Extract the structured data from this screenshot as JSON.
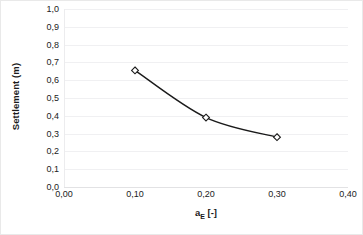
{
  "chart_data": {
    "type": "line",
    "title": "",
    "xlabel": "aₑ [-]",
    "xlabel_base": "a",
    "xlabel_subscript": "E",
    "xlabel_unit": " [-]",
    "ylabel": "Settlement (m)",
    "xlim": [
      0.0,
      0.4
    ],
    "ylim": [
      0.0,
      1.0
    ],
    "x_ticks": [
      0.0,
      0.1,
      0.2,
      0.3,
      0.4
    ],
    "x_tick_labels": [
      "0,00",
      "0,10",
      "0,20",
      "0,30",
      "0,40"
    ],
    "y_ticks": [
      0.0,
      0.1,
      0.2,
      0.3,
      0.4,
      0.5,
      0.6,
      0.7,
      0.8,
      0.9,
      1.0
    ],
    "y_tick_labels": [
      "0,0",
      "0,1",
      "0,2",
      "0,3",
      "0,4",
      "0,5",
      "0,6",
      "0,7",
      "0,8",
      "0,9",
      "1,0"
    ],
    "grid": true,
    "grid_axis": "y",
    "legend": false,
    "legend_position": "none",
    "decimal_separator": ",",
    "marker": "diamond-open",
    "line_color": "#1a1a1a",
    "marker_fill": "#ffffff",
    "marker_edge": "#1a1a1a",
    "grid_color": "#f0f0f2",
    "series": [
      {
        "name": "Settlement",
        "x": [
          0.1,
          0.2,
          0.3
        ],
        "values": [
          0.655,
          0.39,
          0.28
        ]
      }
    ]
  }
}
